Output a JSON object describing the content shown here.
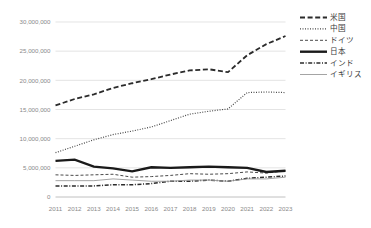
{
  "chart_data": {
    "type": "line",
    "title": "",
    "subtitle": "",
    "xlabel": "",
    "ylabel": "",
    "x": [
      2011,
      2012,
      2013,
      2014,
      2015,
      2016,
      2017,
      2018,
      2019,
      2020,
      2021,
      2022,
      2023
    ],
    "categories": [
      "2011",
      "2012",
      "2013",
      "2014",
      "2015",
      "2016",
      "2017",
      "2018",
      "2019",
      "2020",
      "2021",
      "2022",
      "2023"
    ],
    "ylim": [
      0,
      30000000
    ],
    "ytick_values": [
      0,
      5000000,
      10000000,
      15000000,
      20000000,
      25000000,
      30000000
    ],
    "ytick_labels": [
      "0",
      "5,000,000",
      "10,000,000",
      "15,000,000",
      "20,000,000",
      "25,000,000",
      "30,000,000"
    ],
    "grid": true,
    "legend_position": "right",
    "series": [
      {
        "name": "米国",
        "style": "long-dash",
        "color": "#2b2b2b",
        "width": 1.8,
        "dash": "5,2.6",
        "values": [
          15700000,
          16800000,
          17600000,
          18700000,
          19500000,
          20200000,
          21000000,
          21700000,
          21900000,
          21400000,
          24300000,
          26200000,
          27600000
        ]
      },
      {
        "name": "中国",
        "style": "dotted",
        "color": "#4a4a4a",
        "width": 1.2,
        "dash": "1,1.5",
        "values": [
          7600000,
          8700000,
          9800000,
          10700000,
          11300000,
          12000000,
          13100000,
          14200000,
          14700000,
          15100000,
          17900000,
          18000000,
          17900000
        ]
      },
      {
        "name": "ドイツ",
        "style": "short-dash",
        "color": "#4a4a4a",
        "width": 1.0,
        "dash": "3,2",
        "values": [
          3800000,
          3700000,
          3800000,
          3900000,
          3400000,
          3500000,
          3700000,
          4000000,
          3900000,
          4000000,
          4300000,
          4100000,
          4500000
        ]
      },
      {
        "name": "日本",
        "style": "solid-thick",
        "color": "#1a1a1a",
        "width": 2.4,
        "dash": "none",
        "values": [
          6200000,
          6400000,
          5200000,
          4900000,
          4400000,
          5100000,
          5000000,
          5100000,
          5200000,
          5100000,
          5000000,
          4300000,
          4500000
        ]
      },
      {
        "name": "インド",
        "style": "dash-dot",
        "color": "#2b2b2b",
        "width": 1.5,
        "dash": "4,1.6,1,1.6",
        "values": [
          1900000,
          1900000,
          1900000,
          2100000,
          2100000,
          2300000,
          2700000,
          2700000,
          2900000,
          2700000,
          3200000,
          3400000,
          3600000
        ]
      },
      {
        "name": "イギリス",
        "style": "solid-thin",
        "color": "#9a9a9a",
        "width": 0.9,
        "dash": "none",
        "values": [
          2800000,
          2800000,
          2800000,
          3100000,
          2900000,
          2700000,
          2700000,
          2900000,
          2900000,
          2700000,
          3100000,
          3100000,
          3400000
        ]
      }
    ]
  },
  "legend": {
    "items": [
      {
        "label": "米国"
      },
      {
        "label": "中国"
      },
      {
        "label": "ドイツ"
      },
      {
        "label": "日本"
      },
      {
        "label": "インド"
      },
      {
        "label": "イギリス"
      }
    ]
  }
}
